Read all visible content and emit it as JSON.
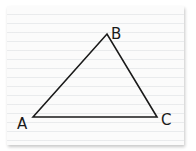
{
  "diagram": {
    "type": "triangle",
    "vertices": [
      {
        "label": "A",
        "x": 33,
        "y": 117
      },
      {
        "label": "B",
        "x": 107,
        "y": 34
      },
      {
        "label": "C",
        "x": 157,
        "y": 117
      }
    ],
    "labels": {
      "a": "A",
      "b": "B",
      "c": "C"
    },
    "stroke_color": "#1a1a1a",
    "paper_color": "#fbfbfb"
  }
}
